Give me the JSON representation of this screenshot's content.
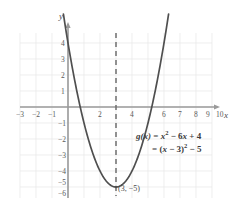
{
  "chart_data": {
    "type": "line",
    "title": "",
    "subtitle": "",
    "xlabel": "x",
    "ylabel": "y",
    "function_label": "g(x)",
    "equation_standard": "g(x) = x² − 6x + 4",
    "equation_vertex": "= (x − 3)² − 5",
    "equation_parts": {
      "gx": "g(x)",
      "equals": "=",
      "x_var": "x",
      "square_exp": "2",
      "minus_6x": "− 6",
      "x_var2": "x",
      "plus_4": "+ 4",
      "equals2": "=",
      "paren_open": "(",
      "x_var3": "x",
      "minus_3": "− 3",
      "paren_close": ")",
      "square_exp2": "2",
      "minus_5": "− 5"
    },
    "coefficients": {
      "a": 1,
      "b": -6,
      "c": 4
    },
    "vertex": {
      "x": 3,
      "y": -5,
      "label": "(3, −5)"
    },
    "roots": [
      0.76,
      5.24
    ],
    "y_intercept": 4,
    "axis_of_symmetry": {
      "x": 3,
      "style": "dashed"
    },
    "xlim": [
      -3.5,
      10.8
    ],
    "ylim": [
      -6.8,
      5.2
    ],
    "grid": true,
    "legend": "none",
    "x_tick_labels": [
      "−3",
      "−2",
      "−1",
      "2",
      "4",
      "6",
      "7",
      "8",
      "9",
      "10"
    ],
    "x_tick_values": [
      -3,
      -2,
      -1,
      2,
      4,
      6,
      7,
      8,
      9,
      10
    ],
    "y_tick_labels": [
      "4",
      "3",
      "2",
      "1",
      "−1",
      "−2",
      "−3",
      "−4",
      "−5",
      "−6"
    ],
    "y_tick_values": [
      4,
      3,
      2,
      1,
      -1,
      -2,
      -3,
      -4,
      -5,
      -6
    ],
    "series": [
      {
        "name": "g(x) = x² − 6x + 4",
        "type": "parabola",
        "points": [
          {
            "x": -0.4,
            "y": 6.56
          },
          {
            "x": 0.0,
            "y": 4.0
          },
          {
            "x": 0.5,
            "y": 1.25
          },
          {
            "x": 1.0,
            "y": -1.0
          },
          {
            "x": 1.5,
            "y": -2.75
          },
          {
            "x": 2.0,
            "y": -4.0
          },
          {
            "x": 2.5,
            "y": -4.75
          },
          {
            "x": 3.0,
            "y": -5.0
          },
          {
            "x": 3.5,
            "y": -4.75
          },
          {
            "x": 4.0,
            "y": -4.0
          },
          {
            "x": 4.5,
            "y": -2.75
          },
          {
            "x": 5.0,
            "y": -1.0
          },
          {
            "x": 5.5,
            "y": 1.25
          },
          {
            "x": 6.0,
            "y": 4.0
          },
          {
            "x": 6.4,
            "y": 6.56
          }
        ]
      }
    ]
  },
  "colors": {
    "grid": "#e4e4e4",
    "axis": "#8a8a8a",
    "curve": "#4a4a4a",
    "dashed": "#6a6a6a",
    "text": "#4a4a4a",
    "background": "#ffffff"
  },
  "axes": {
    "x_axis_label": "x",
    "y_axis_label": "y"
  }
}
